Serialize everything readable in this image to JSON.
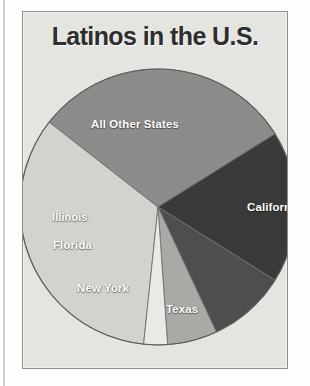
{
  "figure": {
    "title": "Latinos in the U.S."
  },
  "chart_data": {
    "type": "pie",
    "title": "Latinos in the U.S.",
    "xlabel": "",
    "ylabel": "",
    "legend_position": "none",
    "grid": false,
    "labels_on_slices": true,
    "categories": [
      "All Other States",
      "California",
      "Texas",
      "New York",
      "Florida",
      "Illinois"
    ],
    "values": [
      40,
      31,
      18,
      9,
      6,
      3
    ],
    "units": "percent",
    "slices": [
      {
        "label": "All Other States",
        "value": 40,
        "color": "#d2d2ce",
        "start_angle_deg": 186,
        "end_angle_deg": 308,
        "label_color": "#ffffff"
      },
      {
        "label": "California",
        "value": 31,
        "color": "#8c8c8a",
        "start_angle_deg": 308,
        "end_angle_deg": 58,
        "label_color": "#ffffff"
      },
      {
        "label": "Texas",
        "value": 18,
        "color": "#3a3a3a",
        "start_angle_deg": 58,
        "end_angle_deg": 122,
        "label_color": "#ffffff"
      },
      {
        "label": "New York",
        "value": 9,
        "color": "#4e4e4e",
        "start_angle_deg": 122,
        "end_angle_deg": 155,
        "label_color": "#ffffff"
      },
      {
        "label": "Florida",
        "value": 6,
        "color": "#a9a9a6",
        "start_angle_deg": 155,
        "end_angle_deg": 176,
        "label_color": "#ffffff"
      },
      {
        "label": "Illinois",
        "value": 3,
        "color": "#e9e9e5",
        "start_angle_deg": 176,
        "end_angle_deg": 186,
        "label_color": "#ffffff"
      }
    ],
    "colors": {
      "all_other_states": "#d2d2ce",
      "california": "#8c8c8a",
      "texas": "#3a3a3a",
      "new_york": "#4e4e4e",
      "florida": "#a9a9a6",
      "illinois": "#e9e9e5",
      "panel_background": "#e4e4e0",
      "panel_border": "#8e8e8a",
      "page_background": "#fdfdfb",
      "title_text": "#2e2e2e"
    }
  }
}
